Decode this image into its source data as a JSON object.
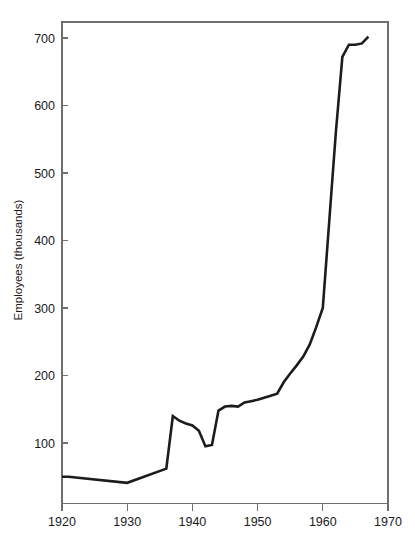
{
  "chart_data": {
    "type": "line",
    "title": "",
    "subtitle": "",
    "xlabel": "",
    "ylabel": "Employees (thousands)",
    "xlim": [
      1920,
      1970
    ],
    "ylim": [
      0,
      730
    ],
    "grid": false,
    "legend": null,
    "x_ticks": [
      1920,
      1930,
      1940,
      1950,
      1960,
      1970
    ],
    "x_tick_labels": [
      "1920",
      "1930",
      "1940",
      "1950",
      "1960",
      "1970"
    ],
    "y_ticks": [
      100,
      200,
      300,
      400,
      500,
      600,
      700
    ],
    "y_tick_labels": [
      "100",
      "200",
      "300",
      "400",
      "500",
      "600",
      "700"
    ],
    "line_color": "#1c1c1c",
    "axis_color": "#6f6f6f",
    "background_color": "#ffffff",
    "series": [
      {
        "name": "Employees",
        "x": [
          1920,
          1921,
          1930,
          1936,
          1937,
          1938,
          1939,
          1940,
          1941,
          1942,
          1943,
          1944,
          1945,
          1946,
          1947,
          1948,
          1949,
          1950,
          1951,
          1952,
          1953,
          1954,
          1955,
          1956,
          1957,
          1958,
          1959,
          1960,
          1961,
          1962,
          1963,
          1964,
          1965,
          1966,
          1967
        ],
        "y": [
          50,
          50,
          41,
          62,
          140,
          133,
          129,
          126,
          118,
          95,
          97,
          148,
          154,
          155,
          154,
          160,
          162,
          164,
          167,
          170,
          173,
          190,
          203,
          215,
          228,
          246,
          272,
          300,
          430,
          560,
          672,
          690,
          690,
          692,
          702
        ]
      }
    ]
  },
  "figure": {
    "width": 415,
    "height": 548
  }
}
